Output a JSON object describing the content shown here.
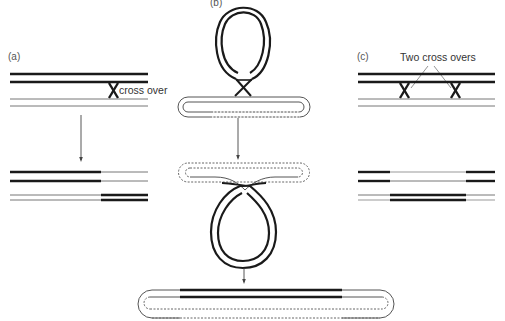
{
  "figure": {
    "panels": [
      {
        "id": "a",
        "label": "(a)",
        "annotation": "cross over",
        "description": "Single crossover between two double-stranded molecules, producing recombinant products"
      },
      {
        "id": "b",
        "label": "(b)",
        "description": "Crossover between a circular molecule and a linear/looped molecule leading to integration"
      },
      {
        "id": "c",
        "label": "(c)",
        "annotation": "Two cross overs",
        "description": "Double crossover between two double-stranded molecules, producing exchanged internal segment"
      }
    ],
    "colors": {
      "thick_strand": "#1a1a1a",
      "thin_strand": "#666666",
      "dashed_strand": "#777777",
      "arrow": "#444444",
      "background": "#ffffff"
    }
  }
}
